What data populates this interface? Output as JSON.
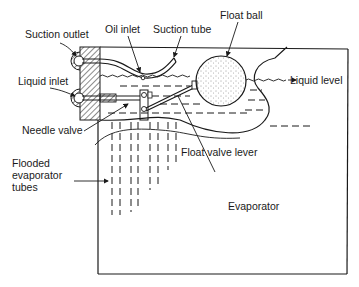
{
  "diagram": {
    "labels": {
      "suction_outlet": "Suction outlet",
      "oil_inlet": "Oil inlet",
      "suction_tube": "Suction tube",
      "float_ball": "Float ball",
      "liquid_inlet": "Liquid inlet",
      "liquid_level": "Liquid level",
      "needle_valve": "Needle valve",
      "float_valve_lever": "Float valve lever",
      "flooded_tubes_line1": "Flooded",
      "flooded_tubes_line2": "evaporator",
      "flooded_tubes_line3": "tubes",
      "evaporator": "Evaporator"
    },
    "colors": {
      "ink": "#1a1a1a",
      "background": "#ffffff"
    }
  }
}
